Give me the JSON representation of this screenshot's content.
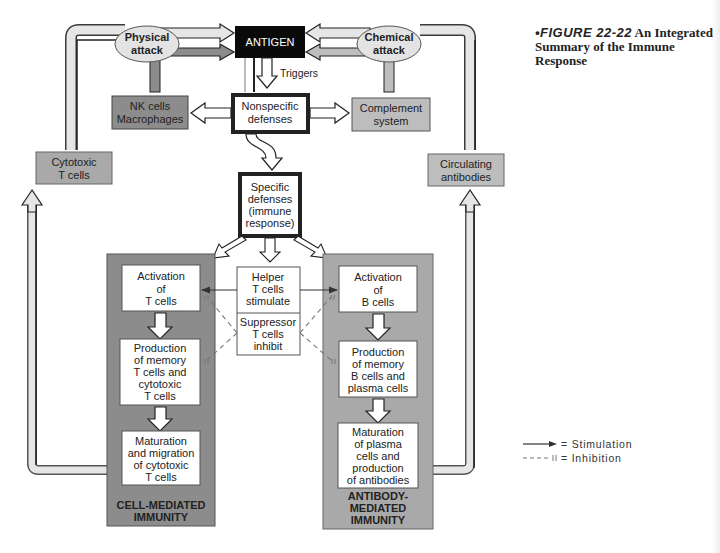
{
  "caption": {
    "figure_label": "•FIGURE 22-22",
    "title": "An Integrated Summary of the Immune Response"
  },
  "nodes": {
    "antigen": "ANTIGEN",
    "triggers": "Triggers",
    "physical_attack": [
      "Physical",
      "attack"
    ],
    "chemical_attack": [
      "Chemical",
      "attack"
    ],
    "nk_cells": [
      "NK cells",
      "Macrophages"
    ],
    "complement": [
      "Complement",
      "system"
    ],
    "nonspecific": [
      "Nonspecific",
      "defenses"
    ],
    "cytotoxic_t": [
      "Cytotoxic",
      "T cells"
    ],
    "circulating_ab": [
      "Circulating",
      "antibodies"
    ],
    "specific": [
      "Specific",
      "defenses",
      "(immune",
      "response)"
    ],
    "helper": [
      "Helper",
      "T cells",
      "stimulate"
    ],
    "suppressor": [
      "Suppressor",
      "T cells",
      "inhibit"
    ],
    "cell_mediated": {
      "label": [
        "CELL-MEDIATED",
        "IMMUNITY"
      ],
      "steps": [
        [
          "Activation",
          "of",
          "T cells"
        ],
        [
          "Production",
          "of memory",
          "T cells and",
          "cytotoxic",
          "T cells"
        ],
        [
          "Maturation",
          "and migration",
          "of cytotoxic",
          "T cells"
        ]
      ]
    },
    "antibody_mediated": {
      "label": [
        "ANTIBODY-",
        "MEDIATED",
        "IMMUNITY"
      ],
      "steps": [
        [
          "Activation",
          "of",
          "B cells"
        ],
        [
          "Production",
          "of memory",
          "B cells and",
          "plasma cells"
        ],
        [
          "Maturation",
          "of plasma",
          "cells and",
          "production",
          "of antibodies"
        ]
      ]
    }
  },
  "legend": {
    "stimulation": "= Stimulation",
    "inhibition": "= Inhibition"
  },
  "colors": {
    "antigen_fill": "#0a0a0a",
    "dark_gray": "#8c8c8c",
    "mid_gray": "#a9a9a9",
    "light_gray": "#bdbdbd",
    "arrow_fill": "#e6e6e6",
    "oval_fill": "#e3e3e3"
  }
}
